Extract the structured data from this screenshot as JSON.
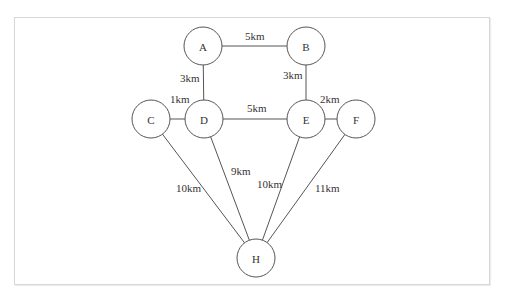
{
  "diagram": {
    "type": "weighted-graph",
    "nodes": [
      {
        "id": "A",
        "label": "A",
        "x": 203,
        "y": 46
      },
      {
        "id": "B",
        "label": "B",
        "x": 306,
        "y": 46
      },
      {
        "id": "C",
        "label": "C",
        "x": 151,
        "y": 119
      },
      {
        "id": "D",
        "label": "D",
        "x": 204,
        "y": 119
      },
      {
        "id": "E",
        "label": "E",
        "x": 306,
        "y": 119
      },
      {
        "id": "F",
        "label": "F",
        "x": 356,
        "y": 119
      },
      {
        "id": "H",
        "label": "H",
        "x": 256,
        "y": 258
      }
    ],
    "edges": [
      {
        "from": "A",
        "to": "B",
        "label": "5km",
        "lx": 245,
        "ly": 40
      },
      {
        "from": "A",
        "to": "D",
        "label": "3km",
        "lx": 180,
        "ly": 82
      },
      {
        "from": "B",
        "to": "E",
        "label": "3km",
        "lx": 283,
        "ly": 79
      },
      {
        "from": "C",
        "to": "D",
        "label": "1km",
        "lx": 170,
        "ly": 103
      },
      {
        "from": "D",
        "to": "E",
        "label": "5km",
        "lx": 247,
        "ly": 112
      },
      {
        "from": "E",
        "to": "F",
        "label": "2km",
        "lx": 320,
        "ly": 103
      },
      {
        "from": "C",
        "to": "H",
        "label": "10km",
        "lx": 176,
        "ly": 192
      },
      {
        "from": "D",
        "to": "H",
        "label": "9km",
        "lx": 231,
        "ly": 175
      },
      {
        "from": "E",
        "to": "H",
        "label": "10km",
        "lx": 257,
        "ly": 188
      },
      {
        "from": "F",
        "to": "H",
        "label": "11km",
        "lx": 315,
        "ly": 192
      }
    ]
  }
}
